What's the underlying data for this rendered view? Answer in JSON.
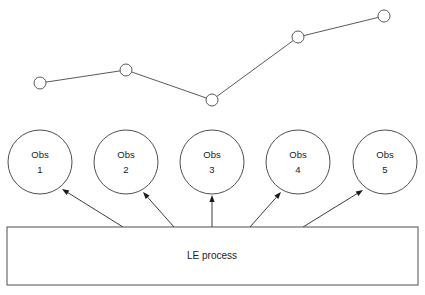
{
  "diagram": {
    "background_color": "#ffffff",
    "line_color": "#5a5a5a",
    "text_color": "#1a1a1a",
    "width": 425,
    "height": 295
  },
  "series": {
    "type": "line",
    "marker": "open-circle",
    "marker_radius": 6,
    "points": [
      {
        "index": 1,
        "x": 40,
        "y": 83
      },
      {
        "index": 2,
        "x": 126,
        "y": 70
      },
      {
        "index": 3,
        "x": 212,
        "y": 100
      },
      {
        "index": 4,
        "x": 298,
        "y": 37
      },
      {
        "index": 5,
        "x": 384,
        "y": 16
      }
    ]
  },
  "observations": [
    {
      "cx": 40,
      "cy": 162,
      "r": 32,
      "line1": "Obs",
      "line2": "1"
    },
    {
      "cx": 126,
      "cy": 162,
      "r": 32,
      "line1": "Obs",
      "line2": "2"
    },
    {
      "cx": 212,
      "cy": 162,
      "r": 32,
      "line1": "Obs",
      "line2": "3"
    },
    {
      "cx": 298,
      "cy": 162,
      "r": 32,
      "line1": "Obs",
      "line2": "4"
    },
    {
      "cx": 385,
      "cy": 162,
      "r": 32,
      "line1": "Obs",
      "line2": "5"
    }
  ],
  "process": {
    "label": "LE process",
    "x": 7,
    "y": 227,
    "width": 411,
    "height": 58,
    "label_cx": 212,
    "label_cy": 256
  },
  "arrows": [
    {
      "from_x": 123,
      "from_y": 227,
      "to_x": 62,
      "to_y": 189,
      "target": "obs-1"
    },
    {
      "from_x": 174,
      "from_y": 227,
      "to_x": 143,
      "to_y": 192,
      "target": "obs-2"
    },
    {
      "from_x": 212,
      "from_y": 227,
      "to_x": 212,
      "to_y": 195,
      "target": "obs-3"
    },
    {
      "from_x": 250,
      "from_y": 227,
      "to_x": 281,
      "to_y": 192,
      "target": "obs-4"
    },
    {
      "from_x": 303,
      "from_y": 227,
      "to_x": 363,
      "to_y": 190,
      "target": "obs-5"
    }
  ],
  "chart_data": {
    "type": "line",
    "title": "",
    "xlabel": "",
    "ylabel": "",
    "categories": [
      "Obs 1",
      "Obs 2",
      "Obs 3",
      "Obs 4",
      "Obs 5"
    ],
    "series": [
      {
        "name": "measurement",
        "values": [
          2,
          3,
          1,
          5,
          6
        ]
      }
    ],
    "grid": false,
    "legend": "none",
    "note": "Values are relative vertical positions read off the plot; higher y-pixel = lower value."
  }
}
